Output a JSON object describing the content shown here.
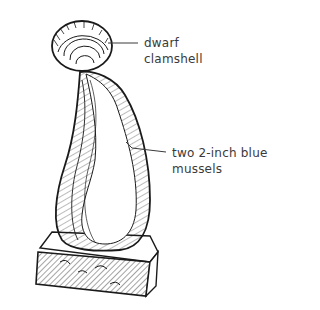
{
  "illustration": {
    "subject": "shell sculpture: dwarf clamshell on top of two mussels on a base block",
    "labels": {
      "clamshell": [
        "dwarf",
        "clamshell"
      ],
      "mussels": [
        "two 2-inch blue",
        "mussels"
      ]
    },
    "colors": {
      "ink": "#1a1a1a",
      "label_text": "#3a3a3a",
      "background": "#ffffff"
    }
  }
}
